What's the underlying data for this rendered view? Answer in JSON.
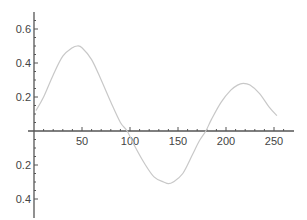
{
  "chart_data": {
    "type": "line",
    "title": "",
    "xlabel": "",
    "ylabel": "",
    "xlim": [
      0,
      265
    ],
    "ylim": [
      -0.46,
      0.7
    ],
    "grid": false,
    "legend": null,
    "x_ticks": [
      50,
      100,
      150,
      200,
      250
    ],
    "x_tick_labels": [
      "50",
      "100",
      "150",
      "200",
      "250"
    ],
    "y_ticks": [
      0.6,
      0.4,
      0.2,
      -0.2,
      -0.4
    ],
    "y_tick_labels": [
      "0.6",
      "0.4",
      "0.2",
      "0.2",
      "0.4"
    ],
    "series": [
      {
        "name": "curve",
        "color": "#c8c8c8",
        "x": [
          2,
          10,
          20,
          30,
          40,
          45,
          50,
          60,
          70,
          80,
          90,
          97,
          105,
          115,
          125,
          135,
          140,
          145,
          155,
          165,
          172,
          179,
          185,
          195,
          205,
          212,
          218,
          225,
          235,
          245,
          253
        ],
        "values": [
          0.12,
          0.2,
          0.33,
          0.44,
          0.49,
          0.5,
          0.49,
          0.42,
          0.3,
          0.17,
          0.05,
          0.0,
          -0.09,
          -0.19,
          -0.27,
          -0.3,
          -0.31,
          -0.3,
          -0.25,
          -0.14,
          -0.06,
          0.0,
          0.07,
          0.17,
          0.24,
          0.27,
          0.28,
          0.27,
          0.22,
          0.14,
          0.09
        ]
      }
    ]
  },
  "colors": {
    "axis": "#555555",
    "curve": "#c8c8c8",
    "background": "#ffffff"
  }
}
